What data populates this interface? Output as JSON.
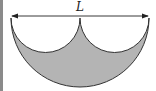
{
  "diagram": {
    "dimension_label": "L",
    "colors": {
      "fill": "#b4b4b4",
      "stroke": "#333333",
      "left_bar": "#8a8a8a"
    }
  }
}
